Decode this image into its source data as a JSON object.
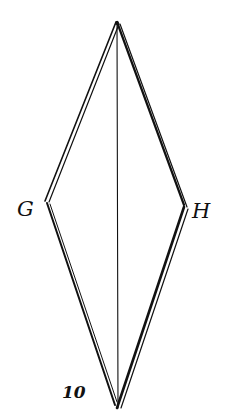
{
  "diagram": {
    "type": "kite-shaped quadrilateral with central vertical line",
    "labels": {
      "left_vertex": "G",
      "right_vertex": "H",
      "page_number": "10"
    },
    "vertices": {
      "top": [
        117,
        22
      ],
      "left": [
        47,
        203
      ],
      "right": [
        185,
        208
      ],
      "bottom": [
        118,
        408
      ]
    },
    "stroke_color": "#111111",
    "background": "#ffffff"
  }
}
